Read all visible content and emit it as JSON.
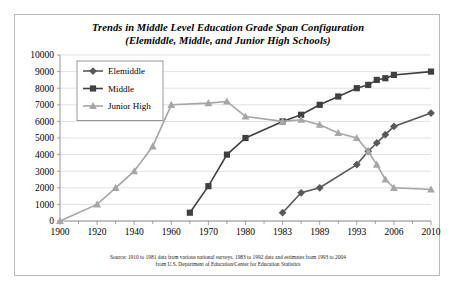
{
  "chart_data": {
    "type": "line",
    "title": "Trends in Middle Level Education Grade Span Configuration (Elemiddle, Middle, and Junior High Schools)",
    "title_lines": [
      "Trends in Middle Level Education Grade Span Configuration",
      "(Elemiddle, Middle, and Junior High Schools)"
    ],
    "xlabel": "",
    "ylabel": "",
    "categories": [
      "1900",
      "1920",
      "1940",
      "1960",
      "1970",
      "1980",
      "1983",
      "1989",
      "1993",
      "2006",
      "2010"
    ],
    "x_tick_labels": [
      "1900",
      "1920",
      "1940",
      "1960",
      "1970",
      "1980",
      "1983",
      "1989",
      "1993",
      "2006",
      "2010"
    ],
    "y_tick_labels": [
      "0",
      "1000",
      "2000",
      "3000",
      "4000",
      "5000",
      "6000",
      "7000",
      "8000",
      "9000",
      "10000"
    ],
    "ylim": [
      0,
      10000
    ],
    "y_tick_step": 1000,
    "grid": true,
    "legend_position": "top-left",
    "series": [
      {
        "name": "Elemiddle",
        "marker": "diamond",
        "color": "#595959",
        "points": [
          {
            "x": "1983",
            "y": 500
          },
          {
            "x": "1986",
            "y": 1700
          },
          {
            "x": "1989",
            "y": 2000
          },
          {
            "x": "1993",
            "y": 3400
          },
          {
            "x": "1997",
            "y": 4200
          },
          {
            "x": "2000",
            "y": 4700
          },
          {
            "x": "2003",
            "y": 5200
          },
          {
            "x": "2006",
            "y": 5700
          },
          {
            "x": "2010",
            "y": 6500
          }
        ]
      },
      {
        "name": "Middle",
        "marker": "square",
        "color": "#404040",
        "points": [
          {
            "x": "1965",
            "y": 500
          },
          {
            "x": "1970",
            "y": 2100
          },
          {
            "x": "1975",
            "y": 4000
          },
          {
            "x": "1980",
            "y": 5000
          },
          {
            "x": "1983",
            "y": 6000
          },
          {
            "x": "1986",
            "y": 6400
          },
          {
            "x": "1989",
            "y": 7000
          },
          {
            "x": "1991",
            "y": 7500
          },
          {
            "x": "1993",
            "y": 8000
          },
          {
            "x": "1997",
            "y": 8200
          },
          {
            "x": "2000",
            "y": 8500
          },
          {
            "x": "2003",
            "y": 8600
          },
          {
            "x": "2006",
            "y": 8800
          },
          {
            "x": "2010",
            "y": 9000
          }
        ]
      },
      {
        "name": "Junior High",
        "marker": "triangle",
        "color": "#a6a6a6",
        "points": [
          {
            "x": "1900",
            "y": 0
          },
          {
            "x": "1920",
            "y": 1000
          },
          {
            "x": "1930",
            "y": 2000
          },
          {
            "x": "1940",
            "y": 3000
          },
          {
            "x": "1950",
            "y": 4500
          },
          {
            "x": "1960",
            "y": 7000
          },
          {
            "x": "1970",
            "y": 7100
          },
          {
            "x": "1975",
            "y": 7200
          },
          {
            "x": "1980",
            "y": 6300
          },
          {
            "x": "1983",
            "y": 6000
          },
          {
            "x": "1986",
            "y": 6100
          },
          {
            "x": "1989",
            "y": 5800
          },
          {
            "x": "1991",
            "y": 5300
          },
          {
            "x": "1993",
            "y": 5000
          },
          {
            "x": "1997",
            "y": 4200
          },
          {
            "x": "2000",
            "y": 3400
          },
          {
            "x": "2003",
            "y": 2500
          },
          {
            "x": "2006",
            "y": 2000
          },
          {
            "x": "2010",
            "y": 1900
          }
        ]
      }
    ],
    "source_lines": [
      "Source: 1910 to 1981 data from various national surveys. 1983 to 1992 data and estimates from 1993 to 2004",
      "from U.S. Department of Education/Center for Education Statistics"
    ]
  }
}
